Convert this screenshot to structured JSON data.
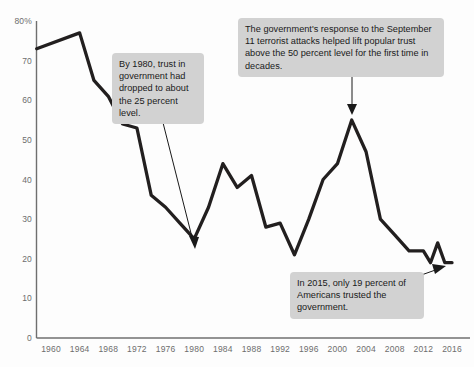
{
  "chart_data": {
    "type": "line",
    "title": "",
    "xlabel": "",
    "ylabel": "",
    "xlim": [
      1958,
      2018
    ],
    "ylim": [
      0,
      80
    ],
    "grid": false,
    "legend": "none",
    "line_color": "#221f1f",
    "x_tick_labels": [
      "1960",
      "1964",
      "1968",
      "1972",
      "1976",
      "1980",
      "1984",
      "1988",
      "1992",
      "1996",
      "2000",
      "2004",
      "2008",
      "2012",
      "2016"
    ],
    "y_tick_labels": [
      "80%",
      "70",
      "60",
      "50",
      "40",
      "30",
      "20",
      "10",
      "0"
    ],
    "y_tick_values": [
      80,
      70,
      60,
      50,
      40,
      30,
      20,
      10,
      0
    ],
    "series": [
      {
        "name": "Trust in government",
        "x": [
          1958,
          1964,
          1966,
          1968,
          1970,
          1972,
          1974,
          1976,
          1978,
          1980,
          1982,
          1984,
          1986,
          1988,
          1990,
          1992,
          1994,
          1996,
          1998,
          2000,
          2002,
          2004,
          2006,
          2008,
          2010,
          2012,
          2013,
          2014,
          2015,
          2016
        ],
        "values": [
          73,
          77,
          65,
          61,
          54,
          53,
          36,
          33,
          29,
          25,
          33,
          44,
          38,
          41,
          28,
          29,
          21,
          30,
          40,
          44,
          55,
          47,
          30,
          26,
          22,
          22,
          19,
          24,
          19,
          19
        ]
      }
    ]
  },
  "annotations": [
    {
      "id": "callout-1980",
      "text": "By 1980, trust in government had dropped to about the 25 percent level.",
      "points_to_year": 1980,
      "points_to_value": 25
    },
    {
      "id": "callout-2001",
      "text": "The government's response to the September 11 terrorist attacks helped lift popular trust above the 50 percent level for the first time in decades.",
      "points_to_year": 2002,
      "points_to_value": 55
    },
    {
      "id": "callout-2015",
      "text": "In 2015, only 19 percent of Americans trusted the government.",
      "points_to_year": 2015,
      "points_to_value": 19
    }
  ],
  "axis": {
    "y_label_80": "80%",
    "y_label_70": "70",
    "y_label_60": "60",
    "y_label_50": "50",
    "y_label_40": "40",
    "y_label_30": "30",
    "y_label_20": "20",
    "y_label_10": "10",
    "y_label_0": "0"
  },
  "colors": {
    "line": "#221f1f",
    "axis": "#6f6f6f",
    "callout_bg": "#d2d2d2",
    "tick_text": "#6d6d6d",
    "background": "#fdfdfd"
  }
}
